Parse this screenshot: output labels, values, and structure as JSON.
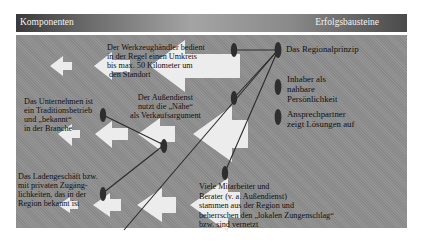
{
  "header": {
    "left_title": "Komponenten",
    "right_title": "Erfolgsbausteine"
  },
  "components": {
    "werkzeughaendler": {
      "lines": [
        "Der Werkzeughändler bedient",
        "in der Regel einen Umkreis",
        "bis max. 50  Kilometer um",
        "den Standort"
      ]
    },
    "aussendienst": {
      "lines": [
        "Der Außendienst",
        "nutzt die „Nähe“",
        "als Verkaufsargument"
      ]
    },
    "unternehmen": {
      "lines": [
        "Das Unternehmen ist",
        "ein Traditionsbetrieb",
        "und „bekannt“",
        "in der Branche"
      ]
    },
    "ladengeschaeft": {
      "lines": [
        "Das Ladengeschäft bzw.",
        "mit privaten Zugäng-",
        "lichkeiten, das in der",
        "Region bekannt ist"
      ]
    },
    "mitarbeiter": {
      "lines": [
        "Viele Mitarbeiter und",
        "Berater (v. a. Außendienst)",
        "stammen aus der Region und",
        "beherrschen den „lokalen Zungenschlag“",
        "bzw. sind vernetzt"
      ]
    }
  },
  "success_factors": [
    {
      "lines": [
        "Das Regionalprinzip"
      ]
    },
    {
      "lines": [
        "Inhaber als",
        "nahbare",
        "Persönlichkeit"
      ]
    },
    {
      "lines": [
        "Ansprechpartner",
        "zeigt Lösungen auf"
      ]
    }
  ],
  "colors": {
    "panel": "#8e8e8e",
    "arrow": "#ececec",
    "connector": "#2a2a2a",
    "node": "#2e2e2e"
  }
}
